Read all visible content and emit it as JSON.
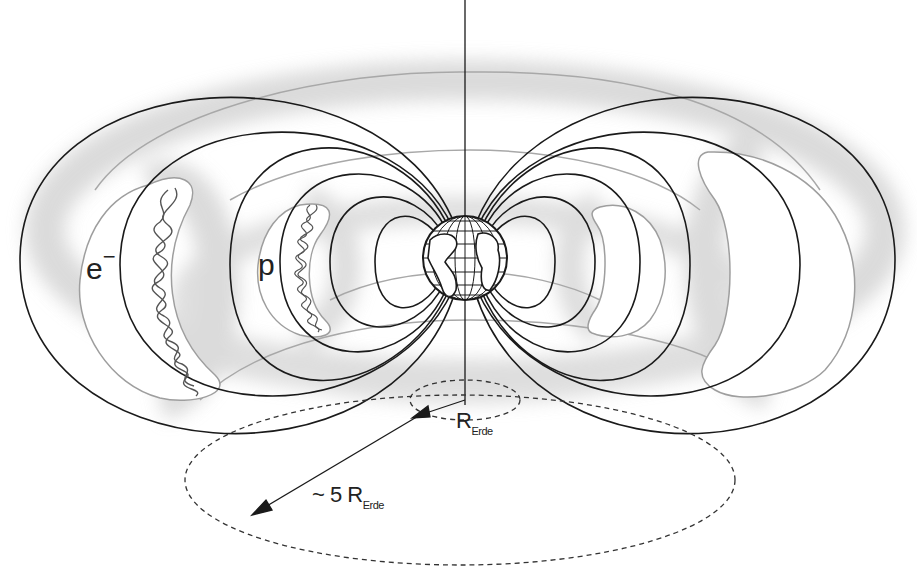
{
  "diagram": {
    "labels": {
      "electron": "e",
      "electron_charge": "−",
      "proton": "p",
      "earth_radius_symbol": "R",
      "earth_radius_sub": "Erde",
      "outer_distance_prefix": "~ 5",
      "outer_distance_symbol": "R",
      "outer_distance_sub": "Erde"
    },
    "colors": {
      "field_lines": "#1a1a1a",
      "belt_shading": "#d8d8d8",
      "belt_edge": "#9a9a9a",
      "background": "#ffffff"
    }
  }
}
